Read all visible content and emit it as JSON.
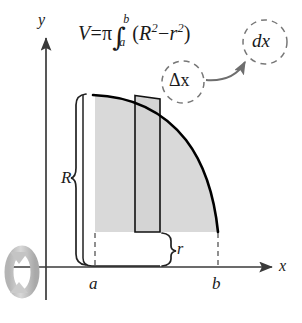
{
  "figure": {
    "formula": {
      "lhs": "V",
      "equals": "=",
      "pi": "π",
      "integral_sign": "∫",
      "lower_limit": "a",
      "upper_limit": "b",
      "open_paren": "(",
      "outer_radius": "R",
      "outer_exponent": "2",
      "minus": "−",
      "inner_radius": "r",
      "inner_exponent": "2",
      "close_paren": ")",
      "differential": "dx",
      "plain_text": "V = π ∫ₐᵇ (R² − r²) dx"
    },
    "annotations": {
      "delta_x": "Δx",
      "dx": "dx",
      "arrow_note": "curved arrow from Δx to dx"
    },
    "axes": {
      "y_label": "y",
      "x_label": "x"
    },
    "labels": {
      "outer_radius": "R",
      "inner_radius": "r",
      "lower_bound": "a",
      "upper_bound": "b"
    },
    "icons": {
      "rotation": "rotation-arrow-icon"
    },
    "colors": {
      "region_fill": "#d9d9d9",
      "strip_fill": "#d4d4d4",
      "curve": "#000000",
      "axis": "#3a3a3a",
      "dashed": "#555555",
      "annotation_circle": "#777777",
      "arrow": "#6e6e6e",
      "rotation_icon": "#c0c0c0",
      "text": "#1a1a1a"
    },
    "geometry": {
      "a_x": 95,
      "b_x": 218,
      "axis_y": 267,
      "region_top_y": 95,
      "region_bottom_y": 232,
      "strip_left_x": 135,
      "strip_right_x": 160,
      "delta_circle": {
        "cx": 183,
        "cy": 82,
        "r": 21
      },
      "dx_circle": {
        "cx": 265,
        "cy": 42,
        "r": 22
      }
    }
  }
}
